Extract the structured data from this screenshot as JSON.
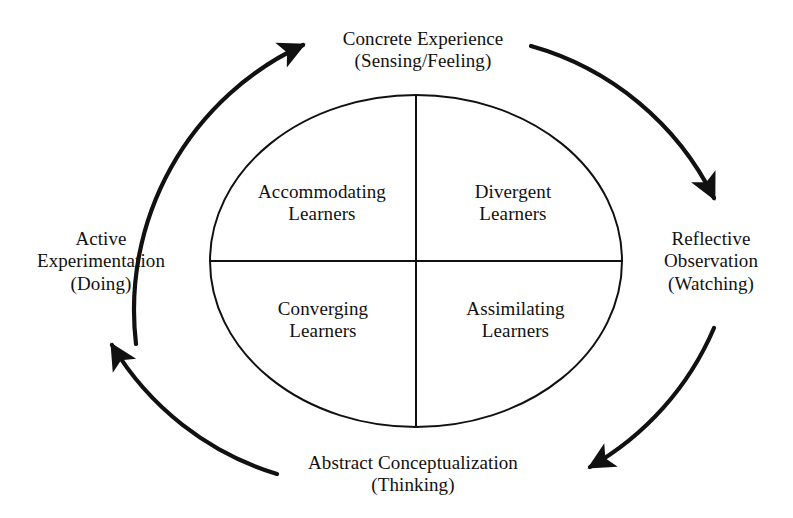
{
  "diagram": {
    "type": "cycle-diagram",
    "background_color": "#ffffff",
    "stroke_color": "#111111"
  },
  "stages": [
    {
      "id": "concrete-experience",
      "position": "top",
      "line1": "Concrete Experience",
      "line2": "(Sensing/Feeling)"
    },
    {
      "id": "reflective-observation",
      "position": "right",
      "line1": "Reflective",
      "line2": "Observation",
      "line3": "(Watching)"
    },
    {
      "id": "abstract-conceptualization",
      "position": "bottom",
      "line1": "Abstract Conceptualization",
      "line2": "(Thinking)"
    },
    {
      "id": "active-experimentation",
      "position": "left",
      "line1": "Active",
      "line2": "Experimentation",
      "line3": "(Doing)"
    }
  ],
  "quadrants": [
    {
      "id": "accommodating-learners",
      "position": "top-left",
      "line1": "Accommodating",
      "line2": "Learners"
    },
    {
      "id": "divergent-learners",
      "position": "top-right",
      "line1": "Divergent",
      "line2": "Learners"
    },
    {
      "id": "converging-learners",
      "position": "bottom-left",
      "line1": "Converging",
      "line2": "Learners"
    },
    {
      "id": "assimilating-learners",
      "position": "bottom-right",
      "line1": "Assimilating",
      "line2": "Learners"
    }
  ],
  "arrows": [
    {
      "id": "arrow-left-to-top",
      "from": "active-experimentation",
      "to": "concrete-experience",
      "direction": "clockwise"
    },
    {
      "id": "arrow-top-to-right",
      "from": "concrete-experience",
      "to": "reflective-observation",
      "direction": "clockwise"
    },
    {
      "id": "arrow-right-to-bottom",
      "from": "reflective-observation",
      "to": "abstract-conceptualization",
      "direction": "clockwise"
    },
    {
      "id": "arrow-bottom-to-left",
      "from": "abstract-conceptualization",
      "to": "active-experimentation",
      "direction": "clockwise"
    }
  ]
}
